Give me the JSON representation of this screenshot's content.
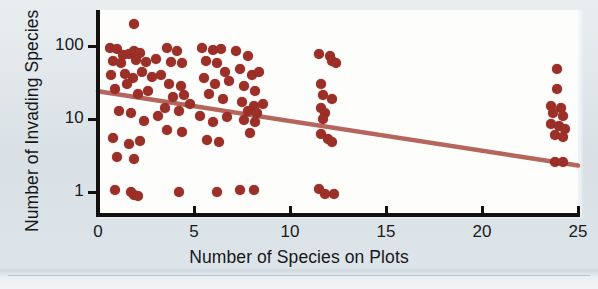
{
  "figure": {
    "background_color": "#dde4e8",
    "panel_color": "#fdfdfc",
    "point_color": "#9c3028",
    "line_color": "#b5655c",
    "axis_color": "#14100f"
  },
  "chart_data": {
    "type": "scatter",
    "title": "",
    "xlabel": "Number of Species on Plots",
    "ylabel": "Number of Invading Species",
    "xlim": [
      0,
      25
    ],
    "ylim": [
      0.8,
      250
    ],
    "yscale": "log",
    "xscale": "linear",
    "grid": false,
    "legend": null,
    "xticks": [
      0,
      5,
      10,
      15,
      20,
      25
    ],
    "xticklabels": [
      "0",
      "5",
      "10",
      "15",
      "20",
      "25"
    ],
    "yticks": [
      1,
      10,
      100
    ],
    "yticklabels": [
      "1",
      "10",
      "100"
    ],
    "points": [
      [
        1.9,
        200
      ],
      [
        0.6,
        95
      ],
      [
        1.0,
        90
      ],
      [
        1.3,
        75
      ],
      [
        1.6,
        78
      ],
      [
        1.9,
        86
      ],
      [
        2.2,
        80
      ],
      [
        0.8,
        62
      ],
      [
        1.2,
        58
      ],
      [
        2.0,
        64
      ],
      [
        2.5,
        60
      ],
      [
        3.0,
        66
      ],
      [
        0.7,
        40
      ],
      [
        1.4,
        42
      ],
      [
        1.8,
        36
      ],
      [
        2.3,
        44
      ],
      [
        2.8,
        38
      ],
      [
        3.3,
        40
      ],
      [
        0.9,
        26
      ],
      [
        1.5,
        30
      ],
      [
        2.1,
        22
      ],
      [
        2.6,
        24
      ],
      [
        1.1,
        13
      ],
      [
        1.7,
        12
      ],
      [
        2.4,
        9.5
      ],
      [
        3.1,
        11
      ],
      [
        0.8,
        5.5
      ],
      [
        1.6,
        4.6
      ],
      [
        2.2,
        5.0
      ],
      [
        1.0,
        3.0
      ],
      [
        1.9,
        2.8
      ],
      [
        0.9,
        1.05
      ],
      [
        1.7,
        1.0
      ],
      [
        1.9,
        0.92
      ],
      [
        2.1,
        0.88
      ],
      [
        3.6,
        95
      ],
      [
        4.1,
        86
      ],
      [
        3.8,
        60
      ],
      [
        4.4,
        58
      ],
      [
        3.7,
        30
      ],
      [
        4.3,
        28
      ],
      [
        3.9,
        20
      ],
      [
        4.5,
        21
      ],
      [
        3.5,
        14
      ],
      [
        4.2,
        13
      ],
      [
        4.8,
        16
      ],
      [
        3.6,
        7.0
      ],
      [
        4.4,
        6.6
      ],
      [
        4.2,
        1.0
      ],
      [
        5.4,
        95
      ],
      [
        6.0,
        88
      ],
      [
        6.4,
        90
      ],
      [
        5.6,
        62
      ],
      [
        6.2,
        58
      ],
      [
        6.6,
        44
      ],
      [
        5.5,
        36
      ],
      [
        6.1,
        30
      ],
      [
        6.8,
        33
      ],
      [
        5.8,
        22
      ],
      [
        6.5,
        19
      ],
      [
        5.3,
        11
      ],
      [
        6.0,
        9.0
      ],
      [
        6.7,
        10.5
      ],
      [
        5.7,
        5.2
      ],
      [
        6.3,
        4.8
      ],
      [
        6.2,
        1.0
      ],
      [
        7.2,
        86
      ],
      [
        7.8,
        74
      ],
      [
        7.4,
        48
      ],
      [
        8.0,
        40
      ],
      [
        8.4,
        44
      ],
      [
        7.6,
        28
      ],
      [
        8.2,
        24
      ],
      [
        7.5,
        17
      ],
      [
        8.1,
        15
      ],
      [
        8.6,
        16
      ],
      [
        7.8,
        13
      ],
      [
        8.3,
        12
      ],
      [
        7.6,
        9.8
      ],
      [
        8.2,
        9.2
      ],
      [
        7.9,
        6.5
      ],
      [
        7.4,
        1.05
      ],
      [
        8.1,
        1.05
      ],
      [
        11.5,
        78
      ],
      [
        12.1,
        74
      ],
      [
        11.6,
        30
      ],
      [
        11.7,
        21
      ],
      [
        12.2,
        19
      ],
      [
        11.6,
        14
      ],
      [
        11.8,
        12
      ],
      [
        11.7,
        10
      ],
      [
        11.6,
        6.2
      ],
      [
        12.0,
        5.4
      ],
      [
        12.2,
        4.8
      ],
      [
        11.5,
        1.1
      ],
      [
        11.8,
        0.95
      ],
      [
        12.3,
        0.95
      ],
      [
        12.2,
        62
      ],
      [
        12.4,
        58
      ],
      [
        23.9,
        48
      ],
      [
        23.9,
        26
      ],
      [
        23.6,
        15
      ],
      [
        24.1,
        14
      ],
      [
        23.7,
        12
      ],
      [
        24.2,
        11
      ],
      [
        23.6,
        8.5
      ],
      [
        24.0,
        8.0
      ],
      [
        24.3,
        7.4
      ],
      [
        23.8,
        6.0
      ],
      [
        24.2,
        5.6
      ],
      [
        23.8,
        2.6
      ],
      [
        24.2,
        2.6
      ]
    ],
    "fit_line": {
      "label": "regression line",
      "x_start": 0,
      "y_start": 24,
      "x_end": 25,
      "y_end": 2.3
    }
  }
}
